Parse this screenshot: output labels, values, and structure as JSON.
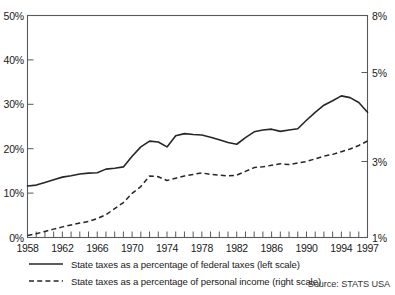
{
  "chart_data": {
    "type": "line",
    "title": "",
    "subtitle": "",
    "xlabel": "",
    "ylabel": "",
    "grid": false,
    "legend_position": "bottom-left",
    "source": "Source: STATS USA",
    "x": [
      1958,
      1959,
      1960,
      1961,
      1962,
      1963,
      1964,
      1965,
      1966,
      1967,
      1968,
      1969,
      1970,
      1971,
      1972,
      1973,
      1974,
      1975,
      1976,
      1977,
      1978,
      1979,
      1980,
      1981,
      1982,
      1983,
      1984,
      1985,
      1986,
      1987,
      1988,
      1989,
      1990,
      1991,
      1992,
      1993,
      1994,
      1995,
      1996,
      1997
    ],
    "xlim": [
      1958,
      1997
    ],
    "x_tick_labels": [
      "1958",
      "1962",
      "1966",
      "1970",
      "1974",
      "1978",
      "1982",
      "1986",
      "1990",
      "1994",
      "1997"
    ],
    "x_tick_values": [
      1958,
      1962,
      1966,
      1970,
      1974,
      1978,
      1982,
      1986,
      1990,
      1994,
      1997
    ],
    "x_minor_tick_every": 1,
    "left_axis": {
      "label": "State taxes as a percentage of federal taxes",
      "tick_labels": [
        "0%",
        "10%",
        "20%",
        "30%",
        "40%",
        "50%"
      ],
      "tick_values": [
        0,
        10,
        20,
        30,
        40,
        50
      ],
      "ylim": [
        0,
        50
      ],
      "unit": "%"
    },
    "right_axis": {
      "label": "State taxes as a percentage of personal income",
      "tick_labels": [
        "1%",
        "3%",
        "5%",
        "8%"
      ],
      "tick_values": [
        1,
        3,
        5,
        8
      ],
      "ylim": [
        1,
        8
      ],
      "unit": "%"
    },
    "series": [
      {
        "name": "State taxes as a percentage of federal taxes (left scale)",
        "axis": "left",
        "style": "solid",
        "color": "#262626",
        "values": [
          11.6,
          11.8,
          12.4,
          13.0,
          13.6,
          13.9,
          14.3,
          14.5,
          14.6,
          15.4,
          15.6,
          15.9,
          18.3,
          20.4,
          21.7,
          21.5,
          20.4,
          22.9,
          23.4,
          23.2,
          23.1,
          22.6,
          22.0,
          21.4,
          21.0,
          22.5,
          23.8,
          24.2,
          24.4,
          23.9,
          24.2,
          24.5,
          26.4,
          28.2,
          29.8,
          30.8,
          31.9,
          31.5,
          30.4,
          28.2
        ]
      },
      {
        "name": "State taxes as a percentage of personal income (right scale)",
        "axis": "right",
        "style": "dashed",
        "color": "#262626",
        "values": [
          1.05,
          1.1,
          1.16,
          1.22,
          1.28,
          1.33,
          1.38,
          1.42,
          1.5,
          1.6,
          1.76,
          1.92,
          2.16,
          2.34,
          2.62,
          2.6,
          2.5,
          2.56,
          2.62,
          2.66,
          2.7,
          2.66,
          2.64,
          2.62,
          2.64,
          2.74,
          2.84,
          2.86,
          2.9,
          2.94,
          2.92,
          2.96,
          3.0,
          3.06,
          3.12,
          3.16,
          3.22,
          3.28,
          3.36,
          3.46
        ]
      }
    ]
  },
  "legend": {
    "items": [
      {
        "style": "solid",
        "label": "State taxes as a percentage of federal taxes (left scale)"
      },
      {
        "style": "dashed",
        "label": "State taxes as a percentage of personal income (right scale)"
      }
    ]
  },
  "footer": {
    "source": "Source: STATS USA"
  },
  "colors": {
    "line": "#262626",
    "axis": "#555a5e",
    "text": "#1a1a1a",
    "background": "#ffffff"
  }
}
